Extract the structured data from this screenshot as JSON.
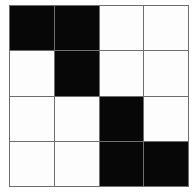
{
  "figure": {
    "name": "four-by-four-binary-grid",
    "rows": 4,
    "columns": 4,
    "colors": {
      "filled": "#070707",
      "empty": "#fdfdfd",
      "gridline": "#6e6e6e",
      "background": "#ffffff"
    },
    "cells": [
      [
        1,
        1,
        0,
        0
      ],
      [
        0,
        1,
        0,
        0
      ],
      [
        0,
        0,
        1,
        0
      ],
      [
        0,
        0,
        1,
        1
      ]
    ],
    "cell_labels": [
      [
        "filled",
        "filled",
        "empty",
        "empty"
      ],
      [
        "empty",
        "filled",
        "empty",
        "empty"
      ],
      [
        "empty",
        "empty",
        "filled",
        "empty"
      ],
      [
        "empty",
        "empty",
        "filled",
        "filled"
      ]
    ]
  }
}
